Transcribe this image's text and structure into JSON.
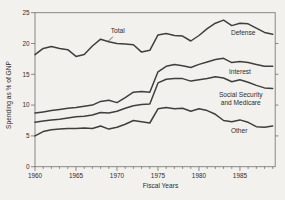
{
  "figure": {
    "background_color": "#f2f1ed",
    "line_color": "#3f3f3f",
    "frame_color": "#7c7c78",
    "text_color": "#2e2e2e"
  },
  "chart_data": {
    "type": "line",
    "title": "",
    "xlabel": "Fiscal Years",
    "ylabel": "Spending as % of GNP",
    "xlim": [
      1960,
      1989.3
    ],
    "ylim": [
      0,
      25
    ],
    "grid": false,
    "frame_box": true,
    "x": [
      1960,
      1961,
      1962,
      1963,
      1964,
      1965,
      1966,
      1967,
      1968,
      1969,
      1970,
      1971,
      1972,
      1973,
      1974,
      1975,
      1976,
      1977,
      1978,
      1979,
      1980,
      1981,
      1982,
      1983,
      1984,
      1985,
      1986,
      1987,
      1988,
      1989
    ],
    "y_ticks_left": [
      0,
      5,
      10,
      15,
      20,
      25
    ],
    "y_ticks_right": [
      5,
      10,
      15,
      20
    ],
    "x_ticks_major": [
      1960,
      1965,
      1970,
      1975,
      1980,
      1985
    ],
    "x_ticks_minor_every_year": true,
    "series": [
      {
        "id": "total",
        "band_label": "Total",
        "values": [
          18.2,
          19.2,
          19.5,
          19.2,
          19.0,
          17.9,
          18.2,
          19.6,
          20.7,
          20.3,
          20.0,
          19.9,
          19.8,
          18.6,
          18.9,
          21.4,
          21.6,
          21.3,
          21.2,
          20.4,
          21.3,
          22.4,
          23.3,
          23.8,
          22.9,
          23.3,
          23.2,
          22.5,
          21.8,
          21.5
        ]
      },
      {
        "id": "defense-lower-boundary",
        "band_label": "Defense",
        "values": [
          8.7,
          8.9,
          9.1,
          9.3,
          9.5,
          9.6,
          9.8,
          10.0,
          10.6,
          10.8,
          10.4,
          11.2,
          12.1,
          12.2,
          12.1,
          15.4,
          16.3,
          16.6,
          16.4,
          16.1,
          16.6,
          17.0,
          17.4,
          17.6,
          16.9,
          17.1,
          16.9,
          16.6,
          16.3,
          16.3
        ]
      },
      {
        "id": "interest-lower-boundary",
        "band_label": "Interest",
        "values": [
          7.2,
          7.4,
          7.6,
          7.7,
          7.9,
          8.1,
          8.2,
          8.4,
          8.8,
          8.7,
          9.0,
          9.5,
          9.9,
          10.1,
          10.2,
          13.6,
          14.2,
          14.3,
          14.3,
          13.9,
          14.1,
          14.3,
          14.6,
          14.4,
          13.8,
          14.1,
          13.7,
          13.2,
          12.8,
          12.7
        ]
      },
      {
        "id": "social-security-medicare-lower-boundary",
        "band_label": "Social Security and Medicare",
        "values": [
          5.0,
          5.7,
          6.0,
          6.1,
          6.2,
          6.2,
          6.3,
          6.2,
          6.6,
          6.1,
          6.4,
          6.9,
          7.5,
          7.3,
          7.1,
          9.4,
          9.6,
          9.4,
          9.5,
          9.0,
          9.4,
          9.1,
          8.5,
          7.5,
          7.3,
          7.6,
          7.2,
          6.5,
          6.4,
          6.6
        ]
      }
    ],
    "annotations": [
      {
        "id": "total-label",
        "text": "Total",
        "x": 1970.1,
        "y": 22.1,
        "anchor": "middle",
        "pointer": {
          "x1": 1969.5,
          "y1": 21.1,
          "x2": 1968.9,
          "y2": 20.3
        }
      },
      {
        "id": "defense-label",
        "text": "Defense",
        "x": 1985.4,
        "y": 21.7,
        "anchor": "middle"
      },
      {
        "id": "interest-label",
        "text": "Interest",
        "x": 1985.0,
        "y": 15.4,
        "anchor": "middle"
      },
      {
        "id": "ss-label-line1",
        "text": "Social Security",
        "x": 1985.1,
        "y": 11.6,
        "anchor": "middle"
      },
      {
        "id": "ss-label-line2",
        "text": "and Medicare",
        "x": 1985.1,
        "y": 10.3,
        "anchor": "middle"
      },
      {
        "id": "other-label",
        "text": "Other",
        "x": 1984.9,
        "y": 5.8,
        "anchor": "middle"
      }
    ]
  }
}
